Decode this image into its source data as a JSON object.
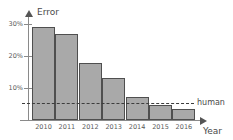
{
  "chart_data": {
    "type": "bar",
    "title": "",
    "xlabel": "Year",
    "ylabel": "Error",
    "categories": [
      "2010",
      "2011",
      "2012",
      "2013",
      "2014",
      "2015",
      "2016"
    ],
    "values": [
      29,
      27,
      17.8,
      13,
      7.2,
      4.7,
      3.4
    ],
    "ylim": [
      0,
      32
    ],
    "ytick_values": [
      10,
      20,
      30
    ],
    "ytick_labels": [
      "10%",
      "20%",
      "30%"
    ],
    "grid": false,
    "legend": "none",
    "annotations": [
      {
        "name": "human-baseline",
        "label": "human",
        "value": 5.3,
        "style": "dashed-horizontal-line"
      }
    ],
    "colors": {
      "bar_fill": "#a9a9a9",
      "bar_stroke": "#4f4f4f",
      "axis": "#8a8a8a",
      "text": "#4a4a4a",
      "dashed_line": "#3d3d3d",
      "background": "#ffffff"
    }
  },
  "axis_titles": {
    "y": "Error",
    "x": "Year"
  },
  "human_label": "human"
}
